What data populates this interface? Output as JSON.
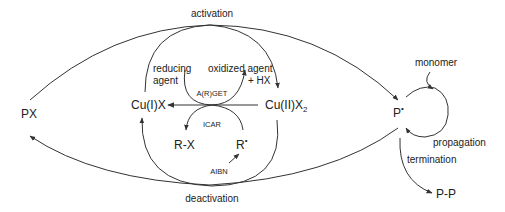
{
  "diagram": {
    "type": "reaction-mechanism",
    "species": {
      "px": "PX",
      "p_radical": "P",
      "p_radical_dot": "•",
      "cu1": "Cu(I)X",
      "cu2_main": "Cu(II)X",
      "cu2_sub": "2",
      "rx": "R-X",
      "r_radical": "R",
      "r_radical_dot": "•",
      "pp": "P-P"
    },
    "labels": {
      "activation": "activation",
      "deactivation": "deactivation",
      "reducing_agent_line1": "reducing",
      "reducing_agent_line2": "agent",
      "oxidized_agent_line1": "oxidized agent",
      "oxidized_agent_line2": "+ HX",
      "argat": "A(R)GET",
      "icar": "ICAR",
      "aibn": "AIBN",
      "monomer": "monomer",
      "propagation": "propagation",
      "termination": "termination"
    },
    "colors": {
      "line": "#333333",
      "text": "#222222",
      "background": "#ffffff"
    }
  }
}
